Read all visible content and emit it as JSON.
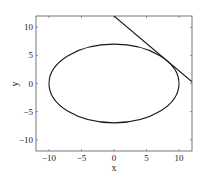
{
  "chart_data": {
    "type": "line",
    "title": "",
    "xlabel": "x",
    "ylabel": "y",
    "xlim": [
      -12,
      12
    ],
    "ylim": [
      -12,
      12
    ],
    "grid": false,
    "legend": null,
    "xticks": [
      -10,
      -5,
      0,
      5,
      10
    ],
    "yticks": [
      -10,
      -5,
      0,
      5,
      10
    ],
    "xtick_labels": [
      "−10",
      "−5",
      "0",
      "5",
      "10"
    ],
    "ytick_labels": [
      "−10",
      "−5",
      "0",
      "5",
      "10"
    ],
    "series": [
      {
        "name": "ellipse",
        "kind": "ellipse",
        "center": [
          0,
          0
        ],
        "semi_axis_x": 10,
        "semi_axis_y": 7,
        "equation": "x^2/100 + y^2/49 = 1",
        "color": "#1a1a1a"
      },
      {
        "name": "tangent line",
        "kind": "line",
        "x": [
          0,
          12
        ],
        "y": [
          12,
          0.3
        ],
        "tangent_point": [
          8.12,
          4.08
        ],
        "color": "#1a1a1a"
      }
    ]
  }
}
